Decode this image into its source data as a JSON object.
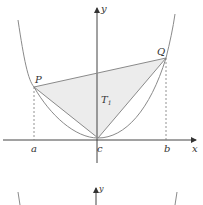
{
  "figure": {
    "top_panel": {
      "axis_labels": {
        "x": "x",
        "y": "y"
      },
      "point_labels": {
        "P": "P",
        "Q": "Q"
      },
      "region_label": "T",
      "region_subscript": "1",
      "tick_labels": {
        "a": "a",
        "c": "c",
        "b": "b"
      }
    },
    "bottom_panel": {
      "axis_labels": {
        "y": "y"
      }
    },
    "colors": {
      "curve": "#8a8a8a",
      "axis": "#444444",
      "fill": "#ececec",
      "dashed": "#777777"
    }
  }
}
